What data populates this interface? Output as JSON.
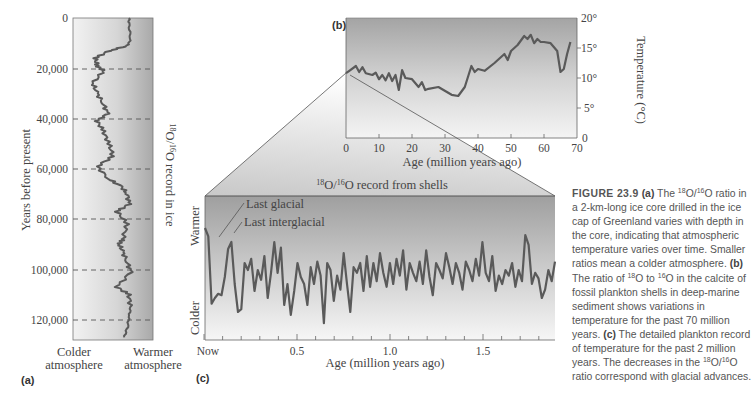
{
  "chart_data": [
    {
      "panel": "(a)",
      "type": "line",
      "title": "18O/16O record in ice",
      "orientation": "vertical",
      "ylabel": "Years before present",
      "xlabel_left": "Colder atmosphere",
      "xlabel_right": "Warmer atmosphere",
      "yticks": [
        "0",
        "20,000",
        "40,000",
        "60,000",
        "80,000",
        "100,000",
        "120,000"
      ],
      "ylim": [
        0,
        128000
      ],
      "grid": "dashed horizontal at each 20,000",
      "x_relative_0_to_1": [
        0.7,
        0.7,
        0.72,
        0.69,
        0.45,
        0.28,
        0.3,
        0.38,
        0.25,
        0.3,
        0.38,
        0.43,
        0.3,
        0.38,
        0.45,
        0.5,
        0.3,
        0.45,
        0.6,
        0.68,
        0.7,
        0.55,
        0.68,
        0.62,
        0.58,
        0.62,
        0.68,
        0.72,
        0.55,
        0.7,
        0.72,
        0.7,
        0.68,
        0.64
      ],
      "y_years": [
        0,
        3000,
        8000,
        11000,
        13000,
        16000,
        19000,
        21000,
        26000,
        30000,
        34000,
        38000,
        41000,
        45000,
        50000,
        55000,
        59000,
        64000,
        67000,
        70000,
        74000,
        77000,
        82000,
        88000,
        90000,
        93000,
        97000,
        101000,
        107000,
        110000,
        115000,
        119000,
        123000,
        127000
      ]
    },
    {
      "panel": "(b)",
      "type": "line",
      "xlabel": "Age (million years ago)",
      "ylabel": "Temperature (°C)",
      "xticks": [
        "0",
        "10",
        "20",
        "30",
        "40",
        "50",
        "60",
        "70"
      ],
      "yticks": [
        "0",
        "5°",
        "10°",
        "15°",
        "20°"
      ],
      "xlim": [
        0,
        70
      ],
      "ylim": [
        0,
        20
      ],
      "x": [
        0,
        1,
        3,
        4,
        5,
        6,
        8,
        9,
        10,
        11,
        12,
        13,
        14,
        15,
        16,
        17,
        18,
        20,
        22,
        23,
        24,
        25,
        28,
        32,
        34,
        36,
        38,
        39,
        40,
        42,
        45,
        47,
        48,
        49,
        50,
        52,
        54,
        55,
        56,
        57,
        58,
        59,
        60,
        62,
        64,
        65,
        66,
        67,
        68
      ],
      "y": [
        10.8,
        11.2,
        12.0,
        11.0,
        11.8,
        10.8,
        10.5,
        10.9,
        9.8,
        10.5,
        9.6,
        10.8,
        9.5,
        10.5,
        8.0,
        11.3,
        10.0,
        9.8,
        8.5,
        9.3,
        8.0,
        8.2,
        8.5,
        7.2,
        7.0,
        8.5,
        12.0,
        11.0,
        11.5,
        11.2,
        12.5,
        13.5,
        14.0,
        13.0,
        14.5,
        15.5,
        17.0,
        16.5,
        17.2,
        15.8,
        16.5,
        16.0,
        16.0,
        15.8,
        14.5,
        11.0,
        11.5,
        14.0,
        16.0
      ]
    },
    {
      "panel": "(c)",
      "type": "line",
      "title": "18O/16O record from shells",
      "xlabel": "Age (million years ago)",
      "ylabel_top": "Warmer",
      "ylabel_bottom": "Colder",
      "xticks": [
        "Now",
        "0.5",
        "1.0",
        "1.5"
      ],
      "xlim": [
        0,
        1.9
      ],
      "annotations": [
        "Last glacial",
        "Last interglacial"
      ],
      "y_relative_0_to_1": [
        0.8,
        0.74,
        0.26,
        0.3,
        0.33,
        0.32,
        0.45,
        0.65,
        0.7,
        0.4,
        0.2,
        0.22,
        0.55,
        0.5,
        0.58,
        0.35,
        0.5,
        0.43,
        0.6,
        0.3,
        0.48,
        0.7,
        0.48,
        0.66,
        0.25,
        0.4,
        0.18,
        0.35,
        0.55,
        0.45,
        0.4,
        0.25,
        0.52,
        0.4,
        0.56,
        0.46,
        0.12,
        0.55,
        0.5,
        0.28,
        0.46,
        0.36,
        0.62,
        0.4,
        0.2,
        0.52,
        0.48,
        0.55,
        0.35,
        0.6,
        0.38,
        0.55,
        0.42,
        0.62,
        0.48,
        0.38,
        0.55,
        0.4,
        0.58,
        0.46,
        0.64,
        0.36,
        0.55,
        0.48,
        0.42,
        0.56,
        0.4,
        0.64,
        0.45,
        0.32,
        0.55,
        0.5,
        0.44,
        0.62,
        0.52,
        0.4,
        0.55,
        0.48,
        0.36,
        0.56,
        0.5,
        0.42,
        0.58,
        0.46,
        0.7,
        0.48,
        0.42,
        0.6,
        0.35,
        0.46,
        0.4,
        0.5,
        0.46,
        0.55,
        0.38,
        0.5,
        0.42,
        0.75,
        0.68,
        0.4,
        0.48,
        0.44,
        0.3,
        0.36,
        0.5,
        0.42,
        0.56
      ]
    }
  ],
  "panel_a": {
    "label": "(a)",
    "yaxis_title": "Years before present",
    "side_title_sup1": "18",
    "side_title_o1": "O/",
    "side_title_sup2": "16",
    "side_title_rest": "O record in ice",
    "ticks": [
      "0",
      "20,000",
      "40,000",
      "60,000",
      "80,000",
      "100,000",
      "120,000"
    ],
    "colder_l1": "Colder",
    "colder_l2": "atmosphere",
    "warmer_l1": "Warmer",
    "warmer_l2": "atmosphere"
  },
  "panel_b": {
    "label": "(b)",
    "xticks": [
      "0",
      "10",
      "20",
      "30",
      "40",
      "50",
      "60",
      "70"
    ],
    "yticks": [
      "0",
      "5°",
      "10°",
      "15°",
      "20°"
    ],
    "xlabel": "Age (million years ago)",
    "ylabel": "Temperature (°C)"
  },
  "panel_c": {
    "label": "(c)",
    "title_sup1": "18",
    "title_o1": "O/",
    "title_sup2": "16",
    "title_rest": "O record from shells",
    "annotation_1": "Last glacial",
    "annotation_2": "Last interglacial",
    "warmer": "Warmer",
    "colder": "Colder",
    "xticks": [
      "Now",
      "0.5",
      "1.0",
      "1.5"
    ],
    "xlabel": "Age (million years ago)"
  },
  "caption": {
    "figure": "FIGURE 23.9",
    "a": "(a)",
    "a_text_1": " The ",
    "sup18a": "18",
    "a_text_2": "O/",
    "sup16a": "16",
    "a_text_3": "O ratio in a 2-km-long ice core drilled in the ice cap of Greenland varies with depth in the core, indicating that atmospheric temperature varies over time. Smaller ratios mean a colder atmosphere. ",
    "b": "(b)",
    "b_text_1": " The ratio of ",
    "sup18b": "18",
    "b_text_2": "O to ",
    "sup16b": "16",
    "b_text_3": "O in the calcite of fossil plankton shells in deep-marine sediment shows variations in temperature for the past 70 million years. ",
    "c": "(c)",
    "c_text_1": " The detailed plankton record of temperature for the past 2 million years. The decreases in the ",
    "sup18c": "18",
    "c_text_2": "O/",
    "sup16c": "16",
    "c_text_3": "O ratio correspond with glacial advances."
  }
}
